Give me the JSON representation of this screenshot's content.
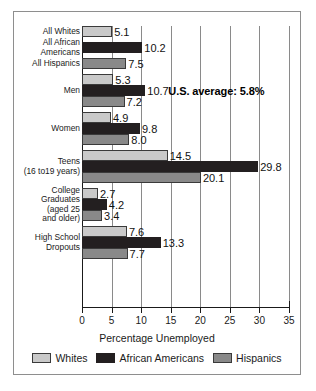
{
  "chart_data": {
    "type": "bar",
    "orientation": "horizontal",
    "title": "",
    "xlabel": "Percentage Unemployed",
    "ylabel": "",
    "xlim": [
      0,
      35
    ],
    "xticks": [
      0,
      5,
      10,
      15,
      20,
      25,
      30,
      35
    ],
    "grid": true,
    "legend_position": "bottom",
    "categories": [
      "All Whites",
      "All African\nAmericans",
      "All Hispanics",
      "Men",
      "Women",
      "Teens\n(16 to19 years)",
      "College\nGraduates\n(aged 25\nand older)",
      "High School\nDropouts"
    ],
    "series": [
      {
        "name": "Whites",
        "color": "#c9c9c9"
      },
      {
        "name": "African Americans",
        "color": "#231f20"
      },
      {
        "name": "Hispanics",
        "color": "#898989"
      }
    ],
    "groups": [
      {
        "label": "All Whites",
        "label_lines": [
          "All Whites"
        ],
        "bars": [
          {
            "series": "Whites",
            "value": 5.1,
            "label": "5.1"
          }
        ]
      },
      {
        "label": "All African Americans",
        "label_lines": [
          "All African",
          "Americans"
        ],
        "bars": [
          {
            "series": "African Americans",
            "value": 10.2,
            "label": "10.2"
          }
        ]
      },
      {
        "label": "All Hispanics",
        "label_lines": [
          "All Hispanics"
        ],
        "bars": [
          {
            "series": "Hispanics",
            "value": 7.5,
            "label": "7.5"
          }
        ]
      },
      {
        "label": "Men",
        "label_lines": [
          "Men"
        ],
        "bars": [
          {
            "series": "Whites",
            "value": 5.3,
            "label": "5.3"
          },
          {
            "series": "African Americans",
            "value": 10.7,
            "label": "10.7"
          },
          {
            "series": "Hispanics",
            "value": 7.2,
            "label": "7.2"
          }
        ]
      },
      {
        "label": "Women",
        "label_lines": [
          "Women"
        ],
        "bars": [
          {
            "series": "Whites",
            "value": 4.9,
            "label": "4.9"
          },
          {
            "series": "African Americans",
            "value": 9.8,
            "label": "9.8"
          },
          {
            "series": "Hispanics",
            "value": 8.0,
            "label": "8.0"
          }
        ]
      },
      {
        "label": "Teens (16 to 19 years)",
        "label_lines": [
          "Teens",
          "(16 to19 years)"
        ],
        "bars": [
          {
            "series": "Whites",
            "value": 14.5,
            "label": "14.5"
          },
          {
            "series": "African Americans",
            "value": 29.8,
            "label": "29.8"
          },
          {
            "series": "Hispanics",
            "value": 20.1,
            "label": "20.1"
          }
        ]
      },
      {
        "label": "College Graduates (aged 25 and older)",
        "label_lines": [
          "College",
          "Graduates",
          "(aged 25",
          "and older)"
        ],
        "bars": [
          {
            "series": "Whites",
            "value": 2.7,
            "label": "2.7"
          },
          {
            "series": "African Americans",
            "value": 4.2,
            "label": "4.2"
          },
          {
            "series": "Hispanics",
            "value": 3.4,
            "label": "3.4"
          }
        ]
      },
      {
        "label": "High School Dropouts",
        "label_lines": [
          "High School",
          "Dropouts"
        ],
        "bars": [
          {
            "series": "Whites",
            "value": 7.6,
            "label": "7.6"
          },
          {
            "series": "African Americans",
            "value": 13.3,
            "label": "13.3"
          },
          {
            "series": "Hispanics",
            "value": 7.7,
            "label": "7.7"
          }
        ]
      }
    ],
    "annotations": [
      {
        "text": "U.S. average: 5.8%",
        "value": 5.8
      }
    ]
  },
  "legend": {
    "items": [
      {
        "label": "Whites",
        "swatch": "s0"
      },
      {
        "label": "African Americans",
        "swatch": "s1"
      },
      {
        "label": "Hispanics",
        "swatch": "s2"
      }
    ]
  },
  "axis": {
    "xlabel": "Percentage Unemployed",
    "tick_labels": [
      "0",
      "5",
      "10",
      "15",
      "20",
      "25",
      "30",
      "35"
    ]
  },
  "annotation": {
    "us_average": "U.S. average: 5.8%"
  }
}
